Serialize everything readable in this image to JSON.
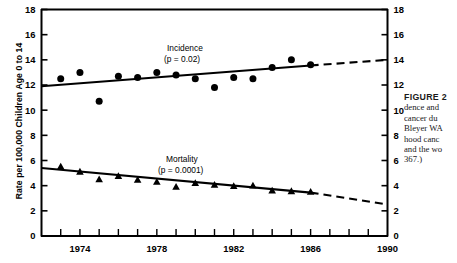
{
  "chart_data": {
    "type": "scatter",
    "title": "",
    "xlabel": "",
    "ylabel": "Rate per 100,000 Children Age 0 to 14",
    "xlim": [
      1972,
      1990
    ],
    "ylim": [
      0,
      18
    ],
    "ytick_step": 2,
    "yticks": [
      0,
      2,
      4,
      6,
      8,
      10,
      12,
      14,
      16,
      18
    ],
    "ytick_labels": [
      "0",
      "2",
      "4",
      "6",
      "8",
      "10",
      "12",
      "14",
      "16",
      "18"
    ],
    "xticks": [
      1973,
      1974,
      1975,
      1976,
      1977,
      1978,
      1979,
      1980,
      1981,
      1982,
      1983,
      1984,
      1985,
      1986,
      1987,
      1988,
      1989
    ],
    "xtick_labels_shown": [
      "1974",
      "1978",
      "1982",
      "1986",
      "1990"
    ],
    "xtick_label_years": [
      1974,
      1978,
      1982,
      1986,
      1990
    ],
    "grid": false,
    "legend_position": "inline-annotation",
    "dual_y_axis": true,
    "series": [
      {
        "name": "Incidence",
        "marker": "circle",
        "annotation": "Incidence",
        "pvalue_text": "(p = 0.02)",
        "x": [
          1973,
          1974,
          1975,
          1976,
          1977,
          1978,
          1979,
          1980,
          1981,
          1982,
          1983,
          1984,
          1985,
          1986
        ],
        "values": [
          12.5,
          13.0,
          10.7,
          12.7,
          12.6,
          13.0,
          12.8,
          12.5,
          11.8,
          12.6,
          12.5,
          13.4,
          14.0,
          13.6
        ],
        "trend_line": {
          "x_start": 1972,
          "y_start": 11.9,
          "x_end": 1986,
          "y_end": 13.55,
          "style": "solid"
        },
        "extrapolation": {
          "x_start": 1986,
          "y_start": 13.55,
          "x_end": 1990,
          "y_end": 14.0,
          "style": "dashed"
        }
      },
      {
        "name": "Mortality",
        "marker": "triangle",
        "annotation": "Mortality",
        "pvalue_text": "(p = 0.0001)",
        "x": [
          1973,
          1974,
          1975,
          1976,
          1977,
          1978,
          1979,
          1980,
          1981,
          1982,
          1983,
          1984,
          1985,
          1986
        ],
        "values": [
          5.5,
          5.1,
          4.5,
          4.75,
          4.45,
          4.3,
          3.9,
          4.2,
          4.05,
          3.95,
          4.0,
          3.6,
          3.55,
          3.5
        ],
        "trend_line": {
          "x_start": 1972,
          "y_start": 5.4,
          "x_end": 1986,
          "y_end": 3.45,
          "style": "solid"
        },
        "extrapolation": {
          "x_start": 1986,
          "y_start": 3.45,
          "x_end": 1990,
          "y_end": 2.5,
          "style": "dashed"
        }
      }
    ]
  },
  "axis": {
    "y_title": "Rate per 100,000 Children Age 0 to 14"
  },
  "annotations": {
    "incidence_label": "Incidence",
    "incidence_p": "(p = 0.02)",
    "mortality_label": "Mortality",
    "mortality_p": "(p = 0.0001)"
  },
  "caption": {
    "heading": "FIGURE 2",
    "lines": [
      "dence and",
      "cancer du",
      "Bleyer WA",
      "hood canc",
      "and the wo",
      "367.)"
    ]
  }
}
